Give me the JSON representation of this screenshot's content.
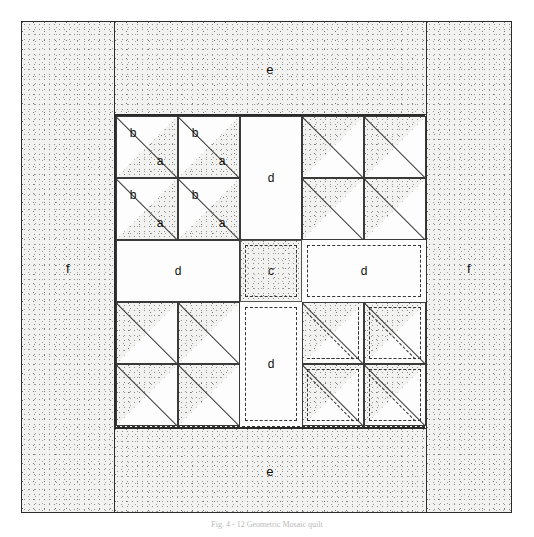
{
  "figure": {
    "caption": "Fig. 4 - 12 Geometric Mosaic quilt"
  },
  "borders": {
    "left_label": "f",
    "right_label": "f",
    "top_label": "e",
    "bottom_label": "e"
  },
  "patch_labels": {
    "a": "a",
    "b": "b",
    "c": "c",
    "d": "d",
    "e": "e",
    "f": "f"
  },
  "center_column": {
    "top_label": "d",
    "middle_label": "c",
    "bottom_label": "d"
  },
  "middle_row": {
    "left_label": "d",
    "center_label": "c",
    "right_label": "d"
  },
  "top_left_unit": {
    "cells": [
      {
        "light": "b",
        "dark": "a"
      },
      {
        "light": "b",
        "dark": "a"
      },
      {
        "light": "b",
        "dark": "a"
      },
      {
        "light": "b",
        "dark": "a"
      }
    ]
  },
  "legend": {
    "a": "a",
    "b": "b",
    "c": "c",
    "d": "d",
    "e": "e",
    "f": "f"
  },
  "colors": {
    "ink": "#2b2b2b",
    "fabric_light": "#fdfdfd",
    "fabric_dotted": "#f2f2f0",
    "dash": "#333333"
  }
}
